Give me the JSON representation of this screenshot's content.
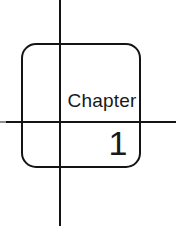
{
  "canvas": {
    "width": 176,
    "height": 244,
    "background_color": "#ffffff",
    "ink_color": "#141414"
  },
  "guides": {
    "vertical_line_name": "vertical-guide-line",
    "horizontal_line_name": "horizontal-guide-line",
    "color": "#141414"
  },
  "card": {
    "shape": "rounded-square-outline",
    "stroke_color": "#141414",
    "fill": "none",
    "chapter_label": "Chapter",
    "chapter_number": "1"
  }
}
